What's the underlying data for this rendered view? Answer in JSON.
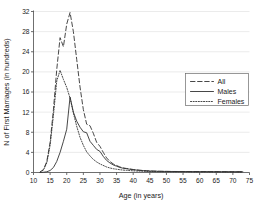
{
  "chart_data": {
    "type": "line",
    "title": "",
    "xlabel": "Age (in years)",
    "ylabel": "N of First Marriages (in hundreds)",
    "xlim": [
      10,
      75
    ],
    "ylim": [
      0,
      32
    ],
    "xticks": [
      10,
      15,
      20,
      25,
      30,
      35,
      40,
      45,
      50,
      55,
      60,
      65,
      70,
      75
    ],
    "yticks": [
      0,
      4,
      8,
      12,
      16,
      20,
      24,
      28,
      32
    ],
    "grid": "horizontal",
    "legend_position": "right-upper",
    "x": [
      12,
      13,
      14,
      15,
      16,
      17,
      18,
      19,
      20,
      21,
      22,
      23,
      24,
      25,
      26,
      27,
      28,
      29,
      30,
      31,
      32,
      33,
      34,
      35,
      36,
      37,
      38,
      39,
      40,
      41,
      42,
      43,
      44,
      45,
      46,
      47,
      48,
      50,
      52,
      55,
      58,
      60,
      63,
      66,
      70,
      73
    ],
    "series": [
      {
        "name": "All",
        "style": "dashed",
        "values": [
          0.1,
          0.6,
          2.2,
          6.0,
          12.5,
          20.5,
          26.8,
          25.0,
          29.5,
          31.8,
          28.0,
          22.5,
          17.0,
          12.5,
          9.6,
          9.3,
          7.8,
          6.0,
          5.2,
          4.0,
          2.9,
          2.2,
          1.7,
          1.4,
          1.1,
          0.9,
          0.8,
          0.7,
          0.6,
          0.5,
          0.45,
          0.4,
          0.35,
          0.3,
          0.28,
          0.26,
          0.24,
          0.22,
          0.2,
          0.2,
          0.18,
          0.18,
          0.17,
          0.16,
          0.15,
          0.15
        ]
      },
      {
        "name": "Males",
        "style": "solid",
        "values": [
          0.0,
          0.05,
          0.15,
          0.4,
          1.0,
          2.2,
          4.0,
          6.2,
          8.6,
          15.0,
          12.0,
          10.2,
          9.0,
          8.1,
          7.9,
          6.2,
          5.4,
          4.6,
          4.2,
          3.2,
          2.4,
          1.9,
          1.5,
          1.25,
          1.0,
          0.85,
          0.75,
          0.65,
          0.55,
          0.5,
          0.42,
          0.38,
          0.33,
          0.3,
          0.27,
          0.25,
          0.23,
          0.21,
          0.2,
          0.19,
          0.18,
          0.17,
          0.16,
          0.15,
          0.14,
          0.14
        ]
      },
      {
        "name": "Females",
        "style": "dotted",
        "values": [
          0.1,
          0.5,
          1.9,
          5.4,
          11.4,
          18.2,
          20.3,
          18.5,
          16.9,
          14.8,
          11.8,
          9.2,
          7.0,
          5.4,
          4.1,
          3.3,
          2.6,
          2.1,
          1.7,
          1.4,
          1.1,
          0.9,
          0.75,
          0.65,
          0.55,
          0.48,
          0.42,
          0.38,
          0.33,
          0.3,
          0.27,
          0.25,
          0.22,
          0.2,
          0.19,
          0.18,
          0.17,
          0.16,
          0.15,
          0.14,
          0.13,
          0.13,
          0.12,
          0.12,
          0.11,
          0.11
        ]
      }
    ],
    "legend": [
      {
        "label": "All",
        "style": "dashed"
      },
      {
        "label": "Males",
        "style": "solid"
      },
      {
        "label": "Females",
        "style": "dotted"
      }
    ],
    "colors": {
      "line": "#333333",
      "grid": "#e2e2e2",
      "axis": "#4a4a4a",
      "text": "#1a1a1a",
      "background": "#ffffff"
    }
  }
}
